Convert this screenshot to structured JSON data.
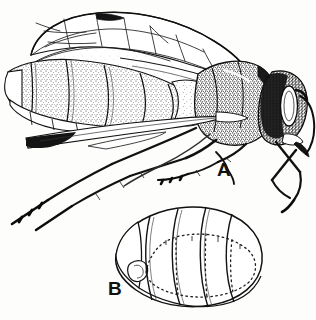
{
  "plate": {
    "title": "Lateral habitus and abdominal detail of a wasp",
    "medium": "pen-and-ink stipple line drawing",
    "background_color": "#fdfdfc",
    "ink_color": "#111111",
    "width": 316,
    "height": 320
  },
  "figures": [
    {
      "id": "A",
      "label": "A",
      "label_x": 217,
      "label_y": 160,
      "caption": "A",
      "view": "lateral habitus, head to the right",
      "parts": [
        "head",
        "compound eye",
        "mandible",
        "antenna",
        "thorax",
        "mesoscutum",
        "propodeum",
        "forewing",
        "hindwing",
        "pterostigma",
        "wing venation cells",
        "abdomen",
        "abdominal terga",
        "ovipositor",
        "fore leg",
        "mid leg",
        "hind leg",
        "tarsus",
        "tibia",
        "femur",
        "coxa"
      ]
    },
    {
      "id": "B",
      "label": "B",
      "label_x": 108,
      "label_y": 279,
      "caption": "B",
      "view": "oblique dorsal view of abdomen, anterior to the left",
      "parts": [
        "abdominal segment 1",
        "abdominal segment 2",
        "abdominal segment 3",
        "abdominal segment 4",
        "abdominal segment 5",
        "petiole",
        "spiracle",
        "dotted segment margins"
      ]
    }
  ]
}
